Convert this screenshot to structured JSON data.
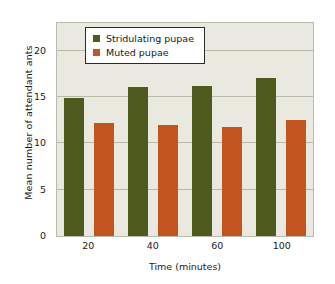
{
  "chart_data": {
    "type": "bar",
    "title": "",
    "xlabel": "Time (minutes)",
    "ylabel": "Mean number of attendant ants",
    "categories": [
      "20",
      "40",
      "60",
      "100"
    ],
    "series": [
      {
        "name": "Stridulating pupae",
        "color": "#4f5a1e",
        "values": [
          14.9,
          16.1,
          16.2,
          17.1
        ]
      },
      {
        "name": "Muted pupae",
        "color": "#c25420",
        "values": [
          12.2,
          12.0,
          11.8,
          12.5
        ]
      }
    ],
    "ylim": [
      0,
      23
    ],
    "yticks": [
      0,
      5,
      10,
      15,
      20
    ],
    "ytick_labels": [
      "0",
      "5",
      "10",
      "15",
      "20"
    ],
    "grid": true,
    "grid_axis": "y",
    "legend_position": "upper-left-inside",
    "plot_background": "#e9e9df",
    "axis_color": "#b9b9ac",
    "figure_background": "#ffffff"
  }
}
